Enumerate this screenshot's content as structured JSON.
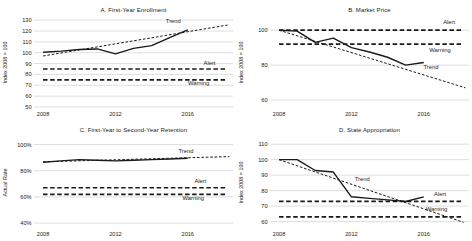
{
  "colors": {
    "line": "#1a1a1a",
    "grid": "#c8c8c8",
    "text": "#1a1a1a",
    "background": "#ffffff"
  },
  "chart_data": [
    {
      "id": "A",
      "type": "line",
      "title": "A. First-Year Enrollment",
      "ylabel": "Index 2008 = 100",
      "ylim": [
        50,
        132
      ],
      "yticks": [
        50,
        60,
        70,
        80,
        90,
        100,
        110,
        120,
        130
      ],
      "ytick_suffix": "",
      "xlim": [
        2007.5,
        2018.5
      ],
      "xticks": [
        2008,
        2012,
        2016
      ],
      "grid": true,
      "series": [
        {
          "name": "Actual",
          "style": "solid",
          "x": [
            2008,
            2009,
            2010,
            2011,
            2012,
            2013,
            2014,
            2015,
            2016
          ],
          "values": [
            100.5,
            101.5,
            103,
            103.5,
            99,
            104,
            106.5,
            114,
            121
          ]
        },
        {
          "name": "Trend",
          "style": "trend",
          "x": [
            2008,
            2018.2
          ],
          "values": [
            97,
            125.5
          ]
        },
        {
          "name": "Alert",
          "style": "threshold",
          "x": [
            2008,
            2018.2
          ],
          "values": [
            85,
            85
          ]
        },
        {
          "name": "Warning",
          "style": "threshold",
          "x": [
            2008,
            2018.2
          ],
          "values": [
            75,
            75
          ]
        }
      ],
      "annotations": [
        {
          "text": "Trend",
          "x": 2015.2,
          "y": 127.5
        },
        {
          "text": "Alert",
          "x": 2017.2,
          "y": 88.8
        },
        {
          "text": "Warning",
          "x": 2016.6,
          "y": 70.5
        }
      ]
    },
    {
      "id": "B",
      "type": "line",
      "title": "B. Market Price",
      "ylabel": "Index 2008 = 100",
      "ylim": [
        56,
        107
      ],
      "yticks": [
        60,
        80,
        100
      ],
      "ytick_suffix": "",
      "xlim": [
        2007.5,
        2018.5
      ],
      "xticks": [
        2008,
        2012,
        2016
      ],
      "grid": true,
      "series": [
        {
          "name": "Actual",
          "style": "solid",
          "x": [
            2008,
            2009,
            2010,
            2011,
            2012,
            2013,
            2014,
            2015,
            2016
          ],
          "values": [
            100,
            99.5,
            93,
            95.5,
            90,
            87.5,
            84.5,
            80,
            81.5
          ]
        },
        {
          "name": "Trend",
          "style": "trend",
          "x": [
            2008,
            2018.3
          ],
          "values": [
            100,
            67
          ]
        },
        {
          "name": "Alert",
          "style": "threshold",
          "x": [
            2008,
            2018.2
          ],
          "values": [
            100,
            100
          ]
        },
        {
          "name": "Warning",
          "style": "threshold",
          "x": [
            2008,
            2018.2
          ],
          "values": [
            92,
            92
          ]
        }
      ],
      "annotations": [
        {
          "text": "Alert",
          "x": 2017.4,
          "y": 103.5
        },
        {
          "text": "Warning",
          "x": 2016.9,
          "y": 87.8
        },
        {
          "text": "Trend",
          "x": 2016.4,
          "y": 77.5
        }
      ]
    },
    {
      "id": "C",
      "type": "line",
      "title": "C. First-Year to Second-Year Retention",
      "ylabel": "Actual Rate",
      "ylim": [
        37,
        105
      ],
      "yticks": [
        40,
        60,
        80,
        100
      ],
      "ytick_suffix": "%",
      "xlim": [
        2007.5,
        2018.5
      ],
      "xticks": [
        2008,
        2012,
        2016
      ],
      "grid": true,
      "series": [
        {
          "name": "Actual",
          "style": "solid",
          "x": [
            2008,
            2009,
            2010,
            2011,
            2012,
            2013,
            2014,
            2015,
            2016
          ],
          "values": [
            86.5,
            87.5,
            88.5,
            88,
            87.5,
            88,
            88.5,
            89,
            89.5
          ]
        },
        {
          "name": "Trend",
          "style": "trend",
          "x": [
            2008,
            2018.3
          ],
          "values": [
            86.8,
            90.8
          ]
        },
        {
          "name": "Alert",
          "style": "threshold",
          "x": [
            2008,
            2018.2
          ],
          "values": [
            67,
            67
          ]
        },
        {
          "name": "Warning",
          "style": "threshold",
          "x": [
            2008,
            2018.2
          ],
          "values": [
            62,
            62
          ]
        }
      ],
      "annotations": [
        {
          "text": "Trend",
          "x": 2015.9,
          "y": 93.8
        },
        {
          "text": "Alert",
          "x": 2016.7,
          "y": 70.3
        },
        {
          "text": "Warning",
          "x": 2016.3,
          "y": 57.8
        }
      ]
    },
    {
      "id": "D",
      "type": "line",
      "title": "D. State Appropriation",
      "ylabel": "Index 2008 = 100",
      "ylim": [
        56.5,
        114
      ],
      "yticks": [
        60,
        70,
        80,
        90,
        100,
        110
      ],
      "ytick_suffix": "",
      "xlim": [
        2007.5,
        2018.5
      ],
      "xticks": [
        2008,
        2012,
        2016
      ],
      "grid": true,
      "series": [
        {
          "name": "Actual",
          "style": "solid",
          "x": [
            2008,
            2009,
            2010,
            2011,
            2012,
            2013,
            2014,
            2015,
            2016
          ],
          "values": [
            100,
            100,
            93,
            92,
            76,
            75,
            74,
            73,
            76
          ]
        },
        {
          "name": "Trend",
          "style": "trend",
          "x": [
            2008,
            2018.2
          ],
          "values": [
            100,
            59.5
          ]
        },
        {
          "name": "Alert",
          "style": "threshold",
          "x": [
            2008,
            2018.2
          ],
          "values": [
            73,
            73
          ]
        },
        {
          "name": "Warning",
          "style": "threshold",
          "x": [
            2008,
            2018.2
          ],
          "values": [
            63,
            63
          ]
        }
      ],
      "annotations": [
        {
          "text": "Trend",
          "x": 2012.6,
          "y": 86
        },
        {
          "text": "Alert",
          "x": 2016.9,
          "y": 76.8
        },
        {
          "text": "Warning",
          "x": 2016.7,
          "y": 66.8
        }
      ]
    }
  ]
}
